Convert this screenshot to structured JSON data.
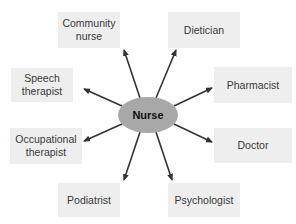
{
  "diagram": {
    "type": "hub-and-spoke",
    "center": {
      "label": "Nurse",
      "color": "#a8a8a8"
    },
    "nodes": [
      {
        "id": "community-nurse",
        "label": "Community nurse"
      },
      {
        "id": "dietician",
        "label": "Dietician"
      },
      {
        "id": "speech-therapist",
        "label": "Speech therapist"
      },
      {
        "id": "pharmacist",
        "label": "Pharmacist"
      },
      {
        "id": "occupational-therapist",
        "label": "Occupational therapist"
      },
      {
        "id": "doctor",
        "label": "Doctor"
      },
      {
        "id": "podiatrist",
        "label": "Podiatrist"
      },
      {
        "id": "psychologist",
        "label": "Psychologist"
      }
    ],
    "edges": "arrows from center to each node",
    "colors": {
      "box_fill": "#eeeeee",
      "arrow": "#333333",
      "text": "#3a3a3a"
    }
  },
  "labels": {
    "center": "Nurse",
    "community_nurse_1": "Community",
    "community_nurse_2": "nurse",
    "dietician": "Dietician",
    "speech_1": "Speech",
    "speech_2": "therapist",
    "pharmacist": "Pharmacist",
    "occupational_1": "Occupational",
    "occupational_2": "therapist",
    "doctor": "Doctor",
    "podiatrist": "Podiatrist",
    "psychologist": "Psychologist"
  }
}
